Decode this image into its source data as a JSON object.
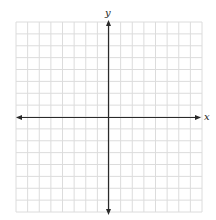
{
  "diagram": {
    "type": "cartesian-grid",
    "x_axis_label": "x",
    "y_axis_label": "y",
    "grid_columns": 16,
    "grid_rows": 16,
    "squares_left_of_y_axis": 8,
    "squares_right_of_y_axis": 8,
    "squares_above_x_axis": 8,
    "squares_below_x_axis": 8,
    "tick_labels": [],
    "arrows": [
      "left",
      "right",
      "up",
      "down"
    ],
    "colors": {
      "grid_line": "#dcdcdc",
      "axis_line": "#2a2a2a",
      "background": "#ffffff"
    }
  }
}
